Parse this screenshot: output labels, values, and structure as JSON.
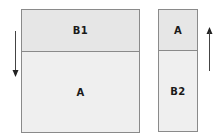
{
  "diagram": {
    "left_block": {
      "top_label": "B1",
      "bottom_label": "A",
      "arrow_direction": "down"
    },
    "right_block": {
      "top_label": "A",
      "bottom_label": "B2",
      "arrow_direction": "up"
    }
  }
}
